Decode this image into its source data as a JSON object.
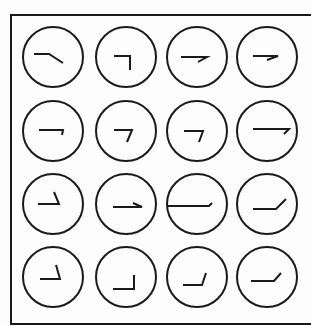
{
  "figure": {
    "stroke_color": "#1a1a1a",
    "background": "#fdfdfd",
    "frame": {
      "left": 11,
      "top": 15,
      "bottom": 324,
      "right": 311
    },
    "circle_radius": 30,
    "col_centers": [
      53,
      126,
      197,
      267
    ],
    "row_centers": [
      57,
      131,
      204,
      277
    ],
    "cells": [
      {
        "row": 0,
        "col": 0,
        "path": "M-19,-3 L-4,-3 L10,6"
      },
      {
        "row": 0,
        "col": 1,
        "path": "M-12,-1 L4,-1 L4,13"
      },
      {
        "row": 0,
        "col": 2,
        "path": "M-16,0 L10,0 L1,5"
      },
      {
        "row": 0,
        "col": 3,
        "path": "M-14,-1 L11,-1 L0,3"
      },
      {
        "row": 1,
        "col": 0,
        "path": "M-14,-1 L10,-1 L9,4"
      },
      {
        "row": 1,
        "col": 1,
        "path": "M-12,-1 L6,-1 L1,11"
      },
      {
        "row": 1,
        "col": 2,
        "path": "M-13,0 L6,0 L2,11"
      },
      {
        "row": 1,
        "col": 3,
        "path": "M-14,-2 L22,-2 L17,3"
      },
      {
        "row": 2,
        "col": 0,
        "path": "M-15,0 L6,0 L1,-12"
      },
      {
        "row": 2,
        "col": 1,
        "path": "M-13,3 L16,3 L7,-1"
      },
      {
        "row": 2,
        "col": 2,
        "path": "M-29,2 L12,2 L15,-1"
      },
      {
        "row": 2,
        "col": 3,
        "path": "M-14,5 L9,5 L19,-5"
      },
      {
        "row": 3,
        "col": 0,
        "path": "M-13,2 L7,2 L3,-12"
      },
      {
        "row": 3,
        "col": 1,
        "path": "M-13,12 L8,12 L8,-2"
      },
      {
        "row": 3,
        "col": 2,
        "path": "M-14,8 L5,8 L9,-4"
      },
      {
        "row": 3,
        "col": 3,
        "path": "M-16,4 L7,4 L14,-4"
      }
    ]
  }
}
